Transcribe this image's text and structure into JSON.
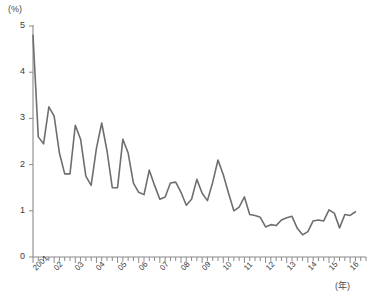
{
  "chart_data": {
    "type": "line",
    "title": "",
    "subtitle": "",
    "xlabel": "(年)",
    "ylabel": "(%)",
    "ylim": [
      0,
      5
    ],
    "xlim": [
      2001,
      2016.75
    ],
    "grid": false,
    "legend": "none",
    "y_ticks": [
      "0",
      "1",
      "2",
      "3",
      "4",
      "5"
    ],
    "y_tick_values": [
      0,
      1,
      2,
      3,
      4,
      5
    ],
    "x_ticks": [
      "2001",
      "02",
      "03",
      "04",
      "05",
      "06",
      "07",
      "08",
      "09",
      "10",
      "11",
      "12",
      "13",
      "14",
      "15",
      "16"
    ],
    "x_tick_values": [
      2001,
      2002,
      2003,
      2004,
      2005,
      2006,
      2007,
      2008,
      2009,
      2010,
      2011,
      2012,
      2013,
      2014,
      2015,
      2016
    ],
    "minor_tick_interval_years": 0.25,
    "series": [
      {
        "name": "series-1",
        "color": "#6e6e6e",
        "x": [
          2001.0,
          2001.25,
          2001.5,
          2001.75,
          2002.0,
          2002.25,
          2002.5,
          2002.75,
          2003.0,
          2003.25,
          2003.5,
          2003.75,
          2004.0,
          2004.25,
          2004.5,
          2004.75,
          2005.0,
          2005.25,
          2005.5,
          2005.75,
          2006.0,
          2006.25,
          2006.5,
          2006.75,
          2007.0,
          2007.25,
          2007.5,
          2007.75,
          2008.0,
          2008.25,
          2008.5,
          2008.75,
          2009.0,
          2009.25,
          2009.5,
          2009.75,
          2010.0,
          2010.25,
          2010.5,
          2010.75,
          2011.0,
          2011.25,
          2011.5,
          2011.75,
          2012.0,
          2012.25,
          2012.5,
          2012.75,
          2013.0,
          2013.25,
          2013.5,
          2013.75,
          2014.0,
          2014.25,
          2014.5,
          2014.75,
          2015.0,
          2015.25,
          2015.5,
          2015.75,
          2016.0,
          2016.25
        ],
        "values": [
          4.8,
          2.6,
          2.45,
          3.25,
          3.05,
          2.25,
          1.8,
          1.8,
          2.85,
          2.55,
          1.75,
          1.55,
          2.35,
          2.9,
          2.3,
          1.5,
          1.5,
          2.55,
          2.25,
          1.6,
          1.4,
          1.35,
          1.88,
          1.55,
          1.25,
          1.3,
          1.6,
          1.62,
          1.4,
          1.12,
          1.25,
          1.68,
          1.38,
          1.22,
          1.62,
          2.1,
          1.78,
          1.38,
          1.0,
          1.08,
          1.3,
          0.92,
          0.9,
          0.86,
          0.65,
          0.7,
          0.68,
          0.8,
          0.85,
          0.88,
          0.62,
          0.48,
          0.55,
          0.78,
          0.8,
          0.78,
          1.02,
          0.95,
          0.63,
          0.92,
          0.9,
          0.98
        ]
      }
    ]
  },
  "axis_labels": {
    "y_unit": "(%)",
    "x_unit": "(年)"
  }
}
